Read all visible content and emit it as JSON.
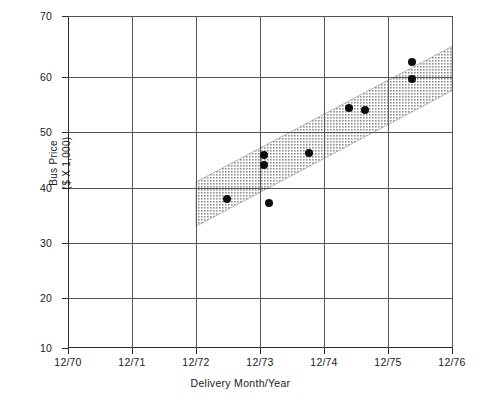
{
  "chart_data": {
    "type": "scatter",
    "title": "",
    "xlabel": "Delivery Month/Year",
    "ylabel": "Bus Price\n($ X 1,000)",
    "ylabel_line1": "Bus Price",
    "ylabel_line2": "($ X 1,000)",
    "grid": true,
    "legend": "none",
    "xlim": [
      0,
      6
    ],
    "ylim": [
      10,
      70
    ],
    "ytick_values": [
      70,
      60,
      50,
      40,
      30,
      20,
      10
    ],
    "ytick_labels": [
      "70",
      "60",
      "50",
      "40",
      "30",
      "20",
      "10"
    ],
    "xtick_values": [
      0,
      1,
      2,
      3,
      4,
      5,
      6
    ],
    "xtick_labels": [
      "12/70",
      "12/71",
      "12/72",
      "12/73",
      "12/74",
      "12/75",
      "12/76"
    ],
    "points": [
      {
        "x": 2.48,
        "y": 37.0,
        "label": "12/72 + 6mo"
      },
      {
        "x": 3.06,
        "y": 44.9,
        "label": "12/73"
      },
      {
        "x": 3.06,
        "y": 43.1,
        "label": "12/73"
      },
      {
        "x": 3.14,
        "y": 36.2,
        "label": "12/73 + 2mo"
      },
      {
        "x": 3.77,
        "y": 45.3,
        "label": "12/74 - 3mo"
      },
      {
        "x": 4.39,
        "y": 53.4,
        "label": "12/74 + 5mo"
      },
      {
        "x": 4.64,
        "y": 53.0,
        "label": "12/74 + 8mo"
      },
      {
        "x": 5.38,
        "y": 61.7,
        "label": "12/75 + 5mo"
      },
      {
        "x": 5.38,
        "y": 58.6,
        "label": "12/75 + 5mo"
      }
    ],
    "band": {
      "name": "trend-band",
      "description": "shaded confidence/trend band",
      "color": "#9a9a9a",
      "start_x": 2.0,
      "end_x": 6.0,
      "upper_start_y": 40.0,
      "upper_end_y": 64.5,
      "lower_start_y": 32.0,
      "lower_end_y": 56.5
    }
  },
  "colors": {
    "axis": "#2a2a2a",
    "grid": "#555555",
    "marker": "#0d0d0d",
    "band": "#9a9a9a",
    "background": "#ffffff"
  }
}
